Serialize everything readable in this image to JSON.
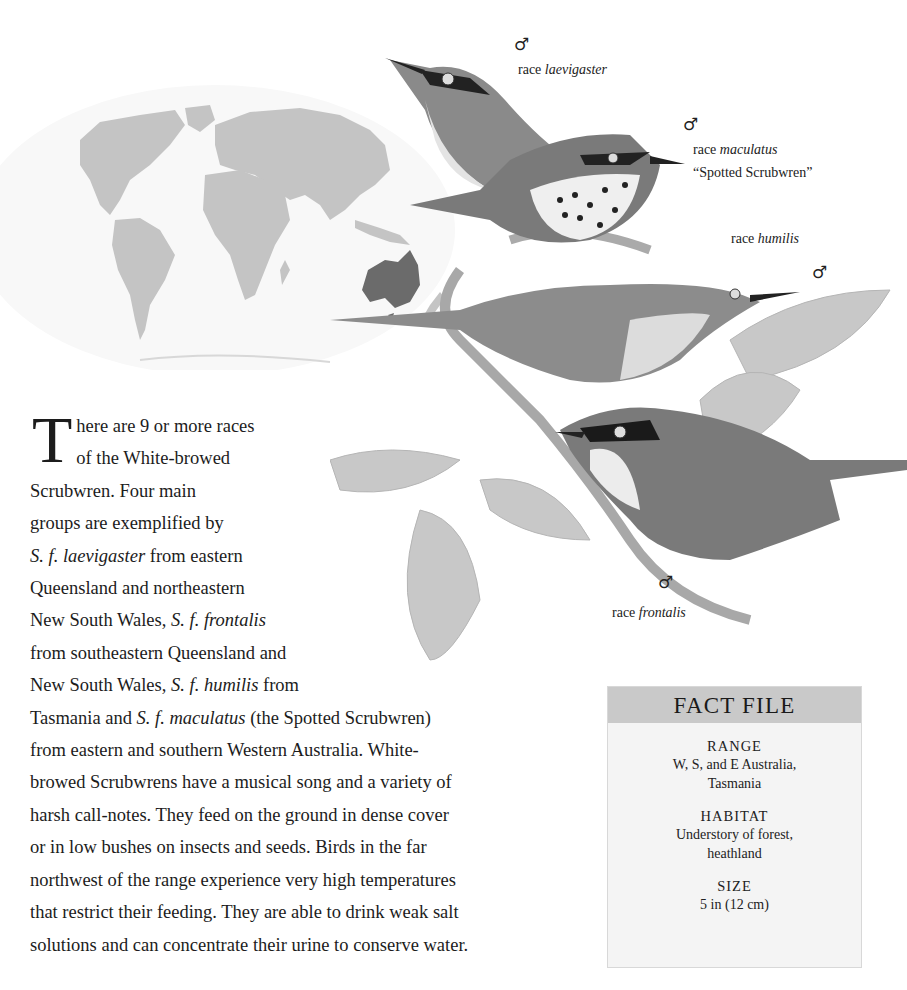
{
  "labels": {
    "male_symbol": "♂",
    "race_prefix": "race",
    "laevigaster": {
      "race": "laevigaster"
    },
    "maculatus": {
      "race": "maculatus",
      "common_name": "“Spotted Scrubwren”"
    },
    "humilis": {
      "race": "humilis"
    },
    "frontalis": {
      "race": "frontalis"
    }
  },
  "map": {
    "highlight_region": "Australia",
    "land_color": "#c4c4c4",
    "highlight_color": "#6b6b6b",
    "ocean_color": "#f7f7f7"
  },
  "body": {
    "drop_cap": "T",
    "lines": [
      {
        "parts": [
          {
            "t": "here are 9 or more races"
          }
        ]
      },
      {
        "parts": [
          {
            "t": "of the White-browed"
          }
        ]
      },
      {
        "parts": [
          {
            "t": "Scrubwren. Four main"
          }
        ]
      },
      {
        "parts": [
          {
            "t": "groups are exemplified by"
          }
        ]
      },
      {
        "parts": [
          {
            "t": "S. f. laevigaster",
            "i": true
          },
          {
            "t": " from eastern"
          }
        ]
      },
      {
        "parts": [
          {
            "t": "Queensland and northeastern"
          }
        ]
      },
      {
        "parts": [
          {
            "t": "New South Wales, "
          },
          {
            "t": "S. f. frontalis",
            "i": true
          }
        ]
      },
      {
        "parts": [
          {
            "t": "from southeastern Queensland and"
          }
        ]
      },
      {
        "parts": [
          {
            "t": "New South Wales, "
          },
          {
            "t": "S. f. humilis",
            "i": true
          },
          {
            "t": " from"
          }
        ]
      },
      {
        "parts": [
          {
            "t": "Tasmania and "
          },
          {
            "t": "S. f. maculatus",
            "i": true
          },
          {
            "t": " (the Spotted Scrubwren)"
          }
        ]
      },
      {
        "parts": [
          {
            "t": "from eastern and southern Western Australia. White-"
          }
        ]
      },
      {
        "parts": [
          {
            "t": "browed Scrubwrens have a musical song and a variety of"
          }
        ]
      },
      {
        "parts": [
          {
            "t": "harsh call-notes. They feed on the ground in dense cover"
          }
        ]
      },
      {
        "parts": [
          {
            "t": "or in low bushes on insects and seeds. Birds in the far"
          }
        ]
      },
      {
        "parts": [
          {
            "t": "northwest of the range experience very high temperatures"
          }
        ]
      },
      {
        "parts": [
          {
            "t": "that restrict their feeding. They are able to drink weak salt"
          }
        ]
      },
      {
        "parts": [
          {
            "t": "solutions and can concentrate their urine to conserve water."
          }
        ]
      }
    ]
  },
  "fact_file": {
    "title": "FACT FILE",
    "sections": [
      {
        "title": "RANGE",
        "lines": [
          "W, S, and E Australia,",
          "Tasmania"
        ]
      },
      {
        "title": "HABITAT",
        "lines": [
          "Understory of forest,",
          "heathland"
        ]
      },
      {
        "title": "SIZE",
        "lines": [
          "5 in (12 cm)"
        ]
      }
    ]
  }
}
